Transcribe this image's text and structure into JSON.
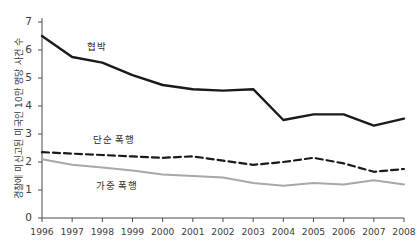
{
  "chart_data": {
    "type": "line",
    "title": "",
    "xlabel": "",
    "ylabel": "경찰에 미신고된 미국인 10만 명당 사건 수",
    "x": [
      1996,
      1997,
      1998,
      1999,
      2000,
      2001,
      2002,
      2003,
      2004,
      2005,
      2006,
      2007,
      2008
    ],
    "xtick_labels": [
      "1996",
      "1997",
      "1998",
      "1999",
      "2000",
      "2001",
      "2002",
      "2003",
      "2004",
      "2005",
      "2006",
      "2007",
      "2008"
    ],
    "ytick_labels": [
      "0",
      "1",
      "2",
      "3",
      "4",
      "5",
      "6",
      "7"
    ],
    "ytick_values": [
      0,
      1,
      2,
      3,
      4,
      5,
      6,
      7
    ],
    "ylim": [
      0,
      7
    ],
    "xlim": [
      1996,
      2008
    ],
    "grid": false,
    "legend_position": "inline-annotations",
    "series": [
      {
        "name": "협박",
        "style": "solid",
        "color": "#1a1a1a",
        "width": 2.4,
        "values": [
          6.5,
          5.75,
          5.55,
          5.1,
          4.75,
          4.6,
          4.55,
          4.6,
          3.5,
          3.7,
          3.7,
          3.3,
          3.55
        ],
        "label_x": 1998.1,
        "label_y": 6.15
      },
      {
        "name": "단순 폭행",
        "style": "dashed",
        "color": "#1a1a1a",
        "width": 2.2,
        "values": [
          2.35,
          2.3,
          2.25,
          2.2,
          2.15,
          2.2,
          2.05,
          1.9,
          2.0,
          2.15,
          1.95,
          1.65,
          1.75
        ],
        "label_x": 1998.3,
        "label_y": 2.82
      },
      {
        "name": "가중 폭행",
        "style": "solid",
        "color": "#a8a8a8",
        "width": 2.0,
        "values": [
          2.1,
          1.9,
          1.8,
          1.7,
          1.55,
          1.5,
          1.45,
          1.25,
          1.15,
          1.25,
          1.2,
          1.35,
          1.2
        ],
        "label_x": 1998.4,
        "label_y": 1.18
      }
    ]
  }
}
